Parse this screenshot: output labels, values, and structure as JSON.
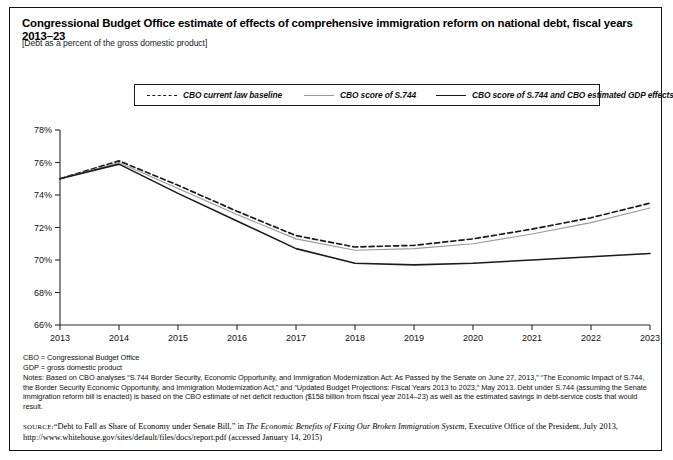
{
  "figure": {
    "title": "Congressional Budget Office estimate of effects of comprehensive immigration reform on national debt, fiscal years 2013–23",
    "subtitle": "[Debt as a percent of the gross domestic product]"
  },
  "legend": {
    "items": [
      {
        "label": "CBO current law baseline",
        "style": "dashed",
        "color": "#1b1b1b"
      },
      {
        "label": "CBO score of S.744",
        "style": "gray",
        "color": "#9a9a9a"
      },
      {
        "label": "CBO score of S.744 and CBO estimated  GDP effects",
        "style": "dark",
        "color": "#1b1b1b"
      }
    ]
  },
  "notes": {
    "abbr1": "CBO = Congressional Budget Office",
    "abbr2": "GDP = gross domestic product",
    "body": "Notes: Based on CBO analyses “S.744 Border Security, Economic Opportunity, and Immigration Modernization Act: As Passed by the Senate on June 27, 2013,” “The Economic Impact of S.744, the Border Security Economic Opportunity, and Immigration Modernization Act,” and “Updated Budget Projections: Fiscal Years 2013 to 2023,” May 2013. Debt under S.744 (assuming the Senate immigration reform bill is enacted) is based on the CBO estimate of net deficit reduction ($158 billion from fiscal year 2014–23) as well as the estimated savings in debt-service costs that would result."
  },
  "source": {
    "label": "source:",
    "text_1": "“Debt to Fall as Share of Economy under Senate Bill,” in ",
    "italic_1": "The Economic Benefits of Fixing Our Broken Immigration System",
    "text_2": ", Executive Office of the President, July 2013, http://www.whitehouse.gov/sites/default/files/docs/report.pdf (accessed January 14, 2015)"
  },
  "chart_data": {
    "type": "line",
    "title": "Congressional Budget Office estimate of effects of comprehensive immigration reform on national debt, fiscal years 2013–23",
    "xlabel": "",
    "ylabel": "Debt as a percent of the gross domestic product",
    "x": [
      2013,
      2014,
      2015,
      2016,
      2017,
      2018,
      2019,
      2020,
      2021,
      2022,
      2023
    ],
    "categories": [
      "2013",
      "2014",
      "2015",
      "2016",
      "2017",
      "2018",
      "2019",
      "2020",
      "2021",
      "2022",
      "2023"
    ],
    "xlim": [
      2013,
      2023
    ],
    "ylim": [
      66,
      78
    ],
    "yticks": [
      66,
      68,
      70,
      72,
      74,
      76,
      78
    ],
    "ytick_labels": [
      "66%",
      "68%",
      "70%",
      "72%",
      "74%",
      "76%",
      "78%"
    ],
    "grid": false,
    "legend_position": "top",
    "series": [
      {
        "name": "CBO current law baseline",
        "style": "dashed",
        "color": "#1b1b1b",
        "values": [
          75.0,
          76.1,
          74.6,
          73.0,
          71.5,
          70.8,
          70.9,
          71.3,
          71.9,
          72.6,
          73.5
        ]
      },
      {
        "name": "CBO score of S.744",
        "style": "solid-gray",
        "color": "#9a9a9a",
        "values": [
          75.0,
          76.0,
          74.4,
          72.8,
          71.3,
          70.6,
          70.7,
          71.0,
          71.6,
          72.3,
          73.2
        ]
      },
      {
        "name": "CBO score of S.744 and CBO estimated  GDP effects",
        "style": "solid-dark",
        "color": "#1b1b1b",
        "values": [
          75.0,
          75.9,
          74.1,
          72.4,
          70.7,
          69.8,
          69.7,
          69.8,
          70.0,
          70.2,
          70.4
        ]
      }
    ]
  }
}
